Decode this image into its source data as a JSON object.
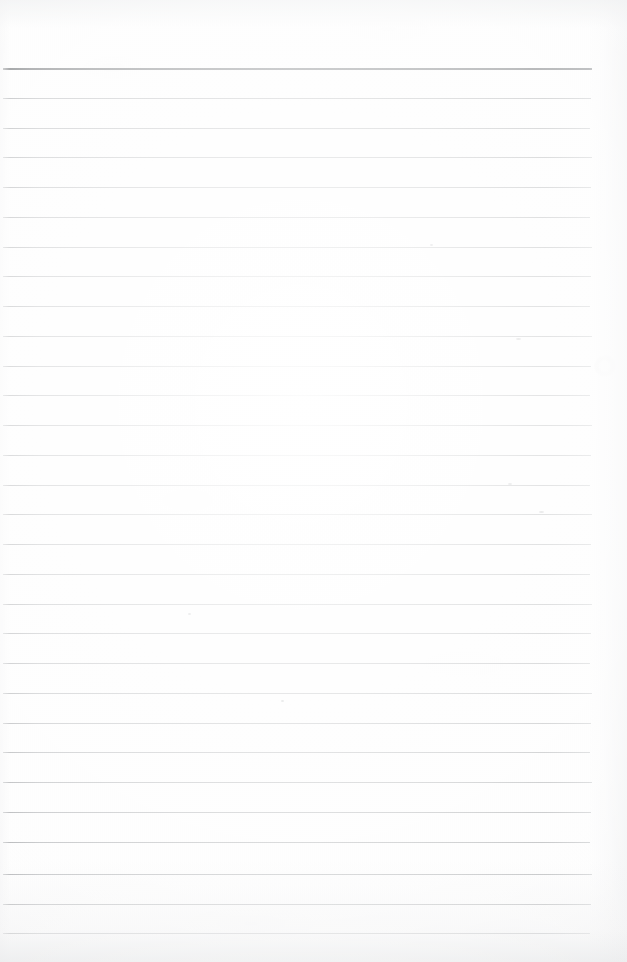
{
  "document": {
    "kind": "scanned-lined-notepad-page",
    "title": "Blank Ruled Notepad Page",
    "description": "A scanned blank sheet of ruled writing paper with a heavy dark header rule at the top and evenly spaced light grey ruled lines down the page.",
    "text_content": "",
    "page_width_px": 627,
    "page_height_px": 962,
    "background_color": "#fdfdfd"
  },
  "ruling": {
    "line_count": 30,
    "line_spacing_px": 29.8,
    "first_line_y_px": 68,
    "last_line_y_px": 933,
    "line_start_x_px": 3,
    "line_end_x_px": 592,
    "line_color": "#b3b5b7",
    "line_thickness_px": 1,
    "header_rule_color": "#6e7174",
    "header_rule_thickness_px": 2,
    "header_rule_index": 0,
    "lines": [
      {
        "index": 0,
        "y": 68,
        "emphasis": "header"
      },
      {
        "index": 1,
        "y": 98,
        "emphasis": "normal"
      },
      {
        "index": 2,
        "y": 128,
        "emphasis": "normal"
      },
      {
        "index": 3,
        "y": 157,
        "emphasis": "normal"
      },
      {
        "index": 4,
        "y": 187,
        "emphasis": "normal"
      },
      {
        "index": 5,
        "y": 217,
        "emphasis": "normal"
      },
      {
        "index": 6,
        "y": 247,
        "emphasis": "normal"
      },
      {
        "index": 7,
        "y": 276,
        "emphasis": "normal"
      },
      {
        "index": 8,
        "y": 306,
        "emphasis": "normal"
      },
      {
        "index": 9,
        "y": 336,
        "emphasis": "normal"
      },
      {
        "index": 10,
        "y": 366,
        "emphasis": "normal"
      },
      {
        "index": 11,
        "y": 395,
        "emphasis": "normal"
      },
      {
        "index": 12,
        "y": 425,
        "emphasis": "normal"
      },
      {
        "index": 13,
        "y": 455,
        "emphasis": "normal"
      },
      {
        "index": 14,
        "y": 485,
        "emphasis": "normal"
      },
      {
        "index": 15,
        "y": 514,
        "emphasis": "normal"
      },
      {
        "index": 16,
        "y": 544,
        "emphasis": "normal"
      },
      {
        "index": 17,
        "y": 574,
        "emphasis": "normal"
      },
      {
        "index": 18,
        "y": 604,
        "emphasis": "normal"
      },
      {
        "index": 19,
        "y": 633,
        "emphasis": "normal"
      },
      {
        "index": 20,
        "y": 663,
        "emphasis": "normal"
      },
      {
        "index": 21,
        "y": 693,
        "emphasis": "normal"
      },
      {
        "index": 22,
        "y": 723,
        "emphasis": "normal"
      },
      {
        "index": 23,
        "y": 752,
        "emphasis": "normal"
      },
      {
        "index": 24,
        "y": 782,
        "emphasis": "normal"
      },
      {
        "index": 25,
        "y": 812,
        "emphasis": "normal"
      },
      {
        "index": 26,
        "y": 842,
        "emphasis": "normal"
      },
      {
        "index": 27,
        "y": 874,
        "emphasis": "normal"
      },
      {
        "index": 28,
        "y": 904,
        "emphasis": "normal"
      },
      {
        "index": 29,
        "y": 933,
        "emphasis": "normal"
      }
    ]
  },
  "artifacts": {
    "smudge": {
      "x": 605,
      "y": 366,
      "size": 22
    },
    "specks": [
      {
        "x": 516,
        "y": 338,
        "w": 5,
        "h": 2
      },
      {
        "x": 508,
        "y": 483,
        "w": 4,
        "h": 2
      },
      {
        "x": 539,
        "y": 511,
        "w": 5,
        "h": 2
      },
      {
        "x": 281,
        "y": 700,
        "w": 3,
        "h": 2
      },
      {
        "x": 188,
        "y": 613,
        "w": 3,
        "h": 2
      },
      {
        "x": 430,
        "y": 244,
        "w": 3,
        "h": 2
      }
    ]
  }
}
